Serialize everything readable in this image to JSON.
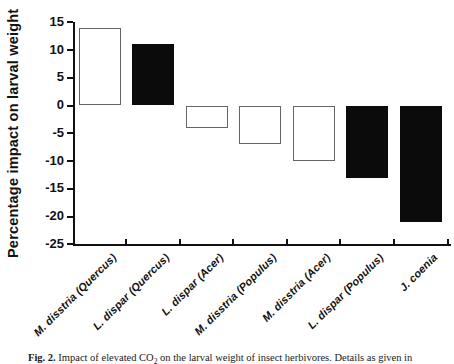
{
  "chart_data": {
    "type": "bar",
    "title": "",
    "xlabel": "",
    "ylabel": "Percentage impact on larval weight",
    "categories": [
      "M. disstria (Quercus)",
      "L. dispar (Quercus)",
      "L. dispar (Acer)",
      "M. disstria (Populus)",
      "M. disstria (Acer)",
      "L. dispar (Populus)",
      "J. coenia"
    ],
    "values": [
      14,
      11,
      -4,
      -7,
      -10,
      -13,
      -21
    ],
    "bar_fills": [
      "white",
      "black",
      "white",
      "white",
      "white",
      "black",
      "black"
    ],
    "ylim": [
      -25,
      15
    ],
    "yticks": [
      15,
      10,
      5,
      0,
      -5,
      -10,
      -15,
      -20,
      -25
    ],
    "grid": false,
    "legend": "none",
    "colors": {
      "bar_black": "#0b0b0b",
      "bar_white": "#ffffff",
      "bar_outline": "#666666",
      "axis": "#111111",
      "text": "#111111"
    }
  },
  "caption": {
    "fig_label": "Fig. 2.",
    "text_before_sub": " Impact of elevated CO",
    "subscript": "2",
    "text_after_sub": " on the larval weight of insect herbivores. Details as given in"
  }
}
